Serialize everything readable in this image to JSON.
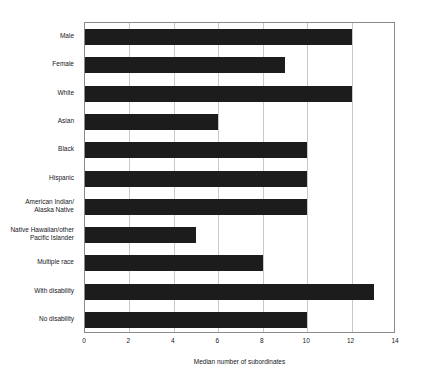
{
  "chart_data": {
    "type": "bar",
    "orientation": "horizontal",
    "title": "",
    "xlabel": "Median number of subordinates",
    "ylabel": "",
    "xlim": [
      0,
      14
    ],
    "xticks": [
      0,
      2,
      4,
      6,
      8,
      10,
      12,
      14
    ],
    "grid": "vertical",
    "legend": "none",
    "bar_color": "#1c1c1c",
    "categories": [
      "Male",
      "Female",
      "White",
      "Asian",
      "Black",
      "Hispanic",
      "American Indian/\nAlaska Native",
      "Native Hawaiian/other\nPacific Islander",
      "Multiple race",
      "With disability",
      "No disability"
    ],
    "values": [
      12,
      9,
      12,
      6,
      10,
      10,
      10,
      5,
      8,
      13,
      10
    ]
  }
}
